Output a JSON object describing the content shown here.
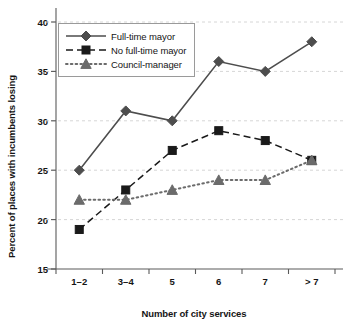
{
  "chart_data": {
    "type": "line",
    "title": "",
    "xlabel": "Number of city services",
    "ylabel": "Percent of places with incumbents losing",
    "categories": [
      "1–2",
      "3–4",
      "5",
      "6",
      "7",
      "> 7"
    ],
    "ylim": [
      15,
      40
    ],
    "yticks": [
      15,
      20,
      25,
      30,
      35,
      40
    ],
    "grid": true,
    "legend_position": "top-left",
    "series": [
      {
        "name": "Full-time mayor",
        "values": [
          25,
          31,
          30,
          36,
          35,
          38
        ],
        "line_style": "solid",
        "marker": "diamond",
        "color": "#4d4d4d"
      },
      {
        "name": "No full-time mayor",
        "values": [
          19,
          23,
          27,
          29,
          28,
          26
        ],
        "line_style": "dashed",
        "marker": "square",
        "color": "#1a1a1a"
      },
      {
        "name": "Council-manager",
        "values": [
          22,
          22,
          23,
          24,
          24,
          26
        ],
        "line_style": "dotted",
        "marker": "triangle",
        "color": "#6b6b6b"
      }
    ]
  },
  "colors": {
    "background": "#ffffff",
    "axis": "#5a5a5a",
    "grid": "#d6d6d6",
    "text": "#151515",
    "legend_border": "#9a9a9a"
  }
}
